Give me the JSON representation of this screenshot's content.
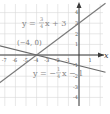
{
  "chart_data": {
    "type": "line",
    "title": "",
    "xlabel": "x",
    "ylabel": "y",
    "xlim": [
      -7.5,
      2.5
    ],
    "ylim": [
      -4.8,
      5
    ],
    "grid": true,
    "x_ticks": [
      "-7",
      "-6",
      "-5",
      "-4",
      "-3",
      "-2",
      "-1",
      "1"
    ],
    "y_ticks": [
      "4",
      "3",
      "2",
      "1",
      "-1",
      "-2",
      "-3",
      "-4"
    ],
    "series": [
      {
        "name": "y = 3/4 x + 3",
        "slope": 0.75,
        "intercept": 3,
        "points": [
          [
            -7.5,
            -2.625
          ],
          [
            2.5,
            4.875
          ]
        ],
        "color": "#7a7a7a"
      },
      {
        "name": "y = -1/4 x - 1",
        "slope": -0.25,
        "intercept": -1,
        "points": [
          [
            -7.5,
            0.875
          ],
          [
            2.5,
            -1.625
          ]
        ],
        "color": "#6a6a6a"
      }
    ],
    "annotations": [
      {
        "text": "(-4, 0)",
        "x": -4,
        "y": 0,
        "type": "intersection-point"
      }
    ]
  },
  "labels": {
    "x_axis": "x",
    "eq1_prefix": "y = ",
    "eq1_num": "3",
    "eq1_den": "4",
    "eq1_suffix": "x + 3",
    "eq2_prefix": "y = −",
    "eq2_num": "1",
    "eq2_den": "4",
    "eq2_suffix": "x − 1",
    "point": "(−4, 0)"
  },
  "ticks": {
    "x": [
      {
        "label": "-7",
        "v": -7
      },
      {
        "label": "-6",
        "v": -6
      },
      {
        "label": "-5",
        "v": -5
      },
      {
        "label": "-4",
        "v": -4
      },
      {
        "label": "-3",
        "v": -3
      },
      {
        "label": "-2",
        "v": -2
      },
      {
        "label": "-1",
        "v": -1
      },
      {
        "label": "1",
        "v": 1
      }
    ],
    "y": [
      {
        "label": "4",
        "v": 4
      },
      {
        "label": "3",
        "v": 3
      },
      {
        "label": "2",
        "v": 2
      },
      {
        "label": "1",
        "v": 1
      },
      {
        "label": "-1",
        "v": -1
      },
      {
        "label": "-2",
        "v": -2
      },
      {
        "label": "-3",
        "v": -3
      },
      {
        "label": "-4",
        "v": -4
      }
    ]
  }
}
